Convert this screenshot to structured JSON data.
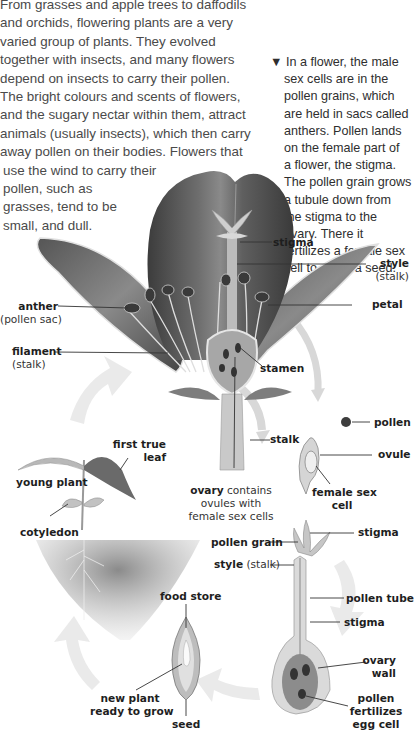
{
  "intro": {
    "lines": [
      "From grasses and apple trees to daffodils",
      "and orchids, flowering plants are a very",
      "varied group of plants. They evolved",
      "together with insects, and many flowers",
      "depend on insects to carry their pollen.",
      "The bright colours and scents of flowers,",
      "and the sugary nectar within them, attract",
      "animals (usually insects), which then carry",
      "away pollen on their bodies. Flowers that",
      "use the wind to carry their",
      "pollen, such as",
      "grasses, tend to be",
      "small, and dull."
    ]
  },
  "caption": {
    "marker": "▼",
    "lines": [
      "In a flower, the male",
      "sex cells are in the",
      "pollen grains, which",
      "are held in sacs called",
      "anthers. Pollen lands",
      "on the female part of",
      "a flower, the stigma.",
      "The pollen grain grows",
      "a tubule down from",
      "the stigma to the",
      "ovary. There it",
      "fertilizes a female sex",
      "cell to make a seed."
    ]
  },
  "labels": {
    "stigma_top": "stigma",
    "style_top": "style",
    "style_top_sub": "(stalk)",
    "petal": "petal",
    "anther": "anther",
    "anther_sub": "(pollen sac)",
    "filament": "filament",
    "filament_sub": "(stalk)",
    "stamen": "stamen",
    "pollen": "pollen",
    "ovule": "ovule",
    "female_sex_cell_1": "female sex",
    "female_sex_cell_2": "cell",
    "stalk": "stalk",
    "ovary_bold": "ovary",
    "ovary_rest": " contains",
    "ovary_line2": "ovules with",
    "ovary_line3": "female sex cells",
    "first_true_leaf_1": "first true",
    "first_true_leaf_2": "leaf",
    "young_plant": "young plant",
    "cotyledon": "cotyledon",
    "pollen_grain": "pollen grain",
    "style_bottom": "style",
    "style_bottom_sub": " (stalk)",
    "stigma_right": "stigma",
    "pollen_tube": "pollen tube",
    "stigma_lower": "stigma",
    "ovary_wall_1": "ovary",
    "ovary_wall_2": "wall",
    "pollen_fertilizes_1": "pollen",
    "pollen_fertilizes_2": "fertilizes",
    "pollen_fertilizes_3": "egg cell",
    "food_store": "food store",
    "new_plant_1": "new plant",
    "new_plant_2": "ready to grow",
    "seed": "seed"
  },
  "colors": {
    "petal_dark": "#4a4a4a",
    "petal_mid": "#7a7a7a",
    "text": "#1e1e1e",
    "arrow": "#e6e6e6"
  }
}
